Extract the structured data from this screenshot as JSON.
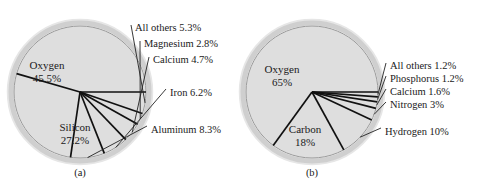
{
  "figure": {
    "background_color": "#ffffff",
    "pie_fill_color": "#dedede",
    "pie_edge_color": "#9a9a9a",
    "line_color": "#111111"
  },
  "chart_data": [
    {
      "type": "pie",
      "id": "chart-a",
      "caption": "(a)",
      "title": "",
      "center": {
        "x": 80,
        "y": 92
      },
      "radius": 66,
      "start_angle_deg": 0,
      "direction": "counterclockwise",
      "categories": [
        "Oxygen",
        "Silicon",
        "Aluminum",
        "Iron",
        "Calcium",
        "Magnesium",
        "All others"
      ],
      "values": [
        45.5,
        27.2,
        8.3,
        6.2,
        4.7,
        2.8,
        5.3
      ],
      "slices": [
        {
          "name": "Oxygen",
          "value": 45.5,
          "label": "Oxygen",
          "value_label": "45.5%",
          "label_position": "inside",
          "text_x": 47,
          "text_y": 69
        },
        {
          "name": "Silicon",
          "value": 27.2,
          "label": "Silicon",
          "value_label": "27.2%",
          "label_position": "inside",
          "text_x": 75,
          "text_y": 131
        },
        {
          "name": "Aluminum",
          "value": 8.3,
          "label": "Aluminum 8.3%",
          "label_position": "outside",
          "text_x": 151,
          "text_y": 129
        },
        {
          "name": "Iron",
          "value": 6.2,
          "label": "Iron 6.2%",
          "label_position": "outside",
          "text_x": 170,
          "text_y": 92
        },
        {
          "name": "Calcium",
          "value": 4.7,
          "label": "Calcium 4.7%",
          "label_position": "outside",
          "text_x": 153,
          "text_y": 60
        },
        {
          "name": "Magnesium",
          "value": 2.8,
          "label": "Magnesium 2.8%",
          "label_position": "outside",
          "text_x": 144,
          "text_y": 44
        },
        {
          "name": "All others",
          "value": 5.3,
          "label": "All others 5.3%",
          "label_position": "outside",
          "text_x": 135,
          "text_y": 28
        }
      ],
      "units": "percent",
      "legend": "none",
      "grid": false
    },
    {
      "type": "pie",
      "id": "chart-b",
      "caption": "(b)",
      "title": "",
      "center": {
        "x": 312,
        "y": 92
      },
      "radius": 66,
      "start_angle_deg": 0,
      "direction": "counterclockwise",
      "categories": [
        "Oxygen",
        "Carbon",
        "Hydrogen",
        "Nitrogen",
        "Calcium",
        "Phosphorus",
        "All others"
      ],
      "values": [
        65,
        18,
        10,
        3,
        1.6,
        1.2,
        1.2
      ],
      "slices": [
        {
          "name": "Oxygen",
          "value": 65,
          "label": "Oxygen",
          "value_label": "65%",
          "label_position": "inside",
          "text_x": 282,
          "text_y": 73
        },
        {
          "name": "Carbon",
          "value": 18,
          "label": "Carbon",
          "value_label": "18%",
          "label_position": "inside",
          "text_x": 305,
          "text_y": 131
        },
        {
          "name": "Hydrogen",
          "value": 10,
          "label": "Hydrogen 10%",
          "label_position": "outside",
          "text_x": 385,
          "text_y": 131
        },
        {
          "name": "Nitrogen",
          "value": 3,
          "label": "Nitrogen 3%",
          "label_position": "outside",
          "text_x": 390,
          "text_y": 105
        },
        {
          "name": "Calcium",
          "value": 1.6,
          "label": "Calcium 1.6%",
          "label_position": "outside",
          "text_x": 390,
          "text_y": 92
        },
        {
          "name": "Phosphorus",
          "value": 1.2,
          "label": "Phosphorus 1.2%",
          "label_position": "outside",
          "text_x": 390,
          "text_y": 79
        },
        {
          "name": "All others",
          "value": 1.2,
          "label": "All others 1.2%",
          "label_position": "outside",
          "text_x": 390,
          "text_y": 66
        }
      ],
      "units": "percent",
      "legend": "none",
      "grid": false
    }
  ]
}
